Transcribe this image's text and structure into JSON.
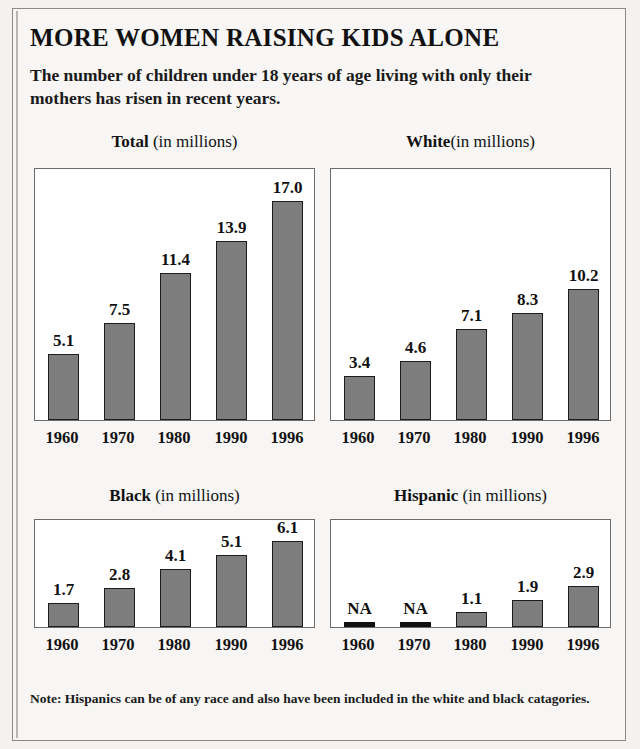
{
  "headline": "MORE WOMEN RAISING KIDS ALONE",
  "subhead": "The number of children under 18 years of age living with only their mothers has risen in recent years.",
  "note": "Note: Hispanics can be of any race and also have been included in the white and black catagories.",
  "colors": {
    "bar_fill": "#7d7d7d",
    "bar_outline": "#1c1c1c",
    "na_bar": "#111111",
    "page_background": "#f7f6f4",
    "plot_background": "#ffffff",
    "frame_border": "#8c8a88",
    "text": "#111111"
  },
  "panels": [
    {
      "category": "Total",
      "unit": " (in millions)",
      "title_full": "Total (in millions)"
    },
    {
      "category": "White",
      "unit": "(in millions)",
      "title_full": "White(in millions)"
    },
    {
      "category": "Black",
      "unit": " (in millions)",
      "title_full": "Black (in millions)"
    },
    {
      "category": "Hispanic",
      "unit": " (in millions)",
      "title_full": "Hispanic (in millions)"
    }
  ],
  "chart_data": [
    {
      "type": "bar",
      "title": "Total (in millions)",
      "xlabel": "",
      "ylabel": "",
      "unit": "millions",
      "categories": [
        "1960",
        "1970",
        "1980",
        "1990",
        "1996"
      ],
      "values": [
        5.1,
        7.5,
        11.4,
        13.9,
        17.0
      ],
      "labels": [
        "5.1",
        "7.5",
        "11.4",
        "13.9",
        "17.0"
      ],
      "ylim": [
        0,
        19.5
      ],
      "grid": false,
      "legend": false
    },
    {
      "type": "bar",
      "title": "White(in millions)",
      "xlabel": "",
      "ylabel": "",
      "unit": "millions",
      "categories": [
        "1960",
        "1970",
        "1980",
        "1990",
        "1996"
      ],
      "values": [
        3.4,
        4.6,
        7.1,
        8.3,
        10.2
      ],
      "labels": [
        "3.4",
        "4.6",
        "7.1",
        "8.3",
        "10.2"
      ],
      "ylim": [
        0,
        19.5
      ],
      "grid": false,
      "legend": false
    },
    {
      "type": "bar",
      "title": "Black (in millions)",
      "xlabel": "",
      "ylabel": "",
      "unit": "millions",
      "categories": [
        "1960",
        "1970",
        "1980",
        "1990",
        "1996"
      ],
      "values": [
        1.7,
        2.8,
        4.1,
        5.1,
        6.1
      ],
      "labels": [
        "1.7",
        "2.8",
        "4.1",
        "5.1",
        "6.1"
      ],
      "ylim": [
        0,
        7.6
      ],
      "grid": false,
      "legend": false
    },
    {
      "type": "bar",
      "title": "Hispanic (in millions)",
      "xlabel": "",
      "ylabel": "",
      "unit": "millions",
      "categories": [
        "1960",
        "1970",
        "1980",
        "1990",
        "1996"
      ],
      "values": [
        null,
        null,
        1.1,
        1.9,
        2.9
      ],
      "labels": [
        "NA",
        "NA",
        "1.1",
        "1.9",
        "2.9"
      ],
      "ylim": [
        0,
        7.6
      ],
      "grid": false,
      "legend": false
    }
  ]
}
